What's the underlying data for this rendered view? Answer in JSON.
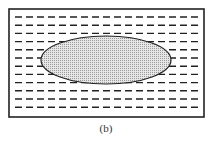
{
  "figure": {
    "caption": "(b)",
    "frame": {
      "x": 9,
      "y": 9,
      "width": 195,
      "height": 108,
      "stroke": "#222"
    },
    "dash_rows": {
      "count": 12,
      "start_y": 17,
      "spacing": 8.2,
      "color": "#222"
    },
    "ellipse": {
      "cx": 106,
      "cy": 60,
      "rx": 65,
      "ry": 24,
      "fill": "#dcdcdc",
      "stroke": "#222"
    }
  }
}
